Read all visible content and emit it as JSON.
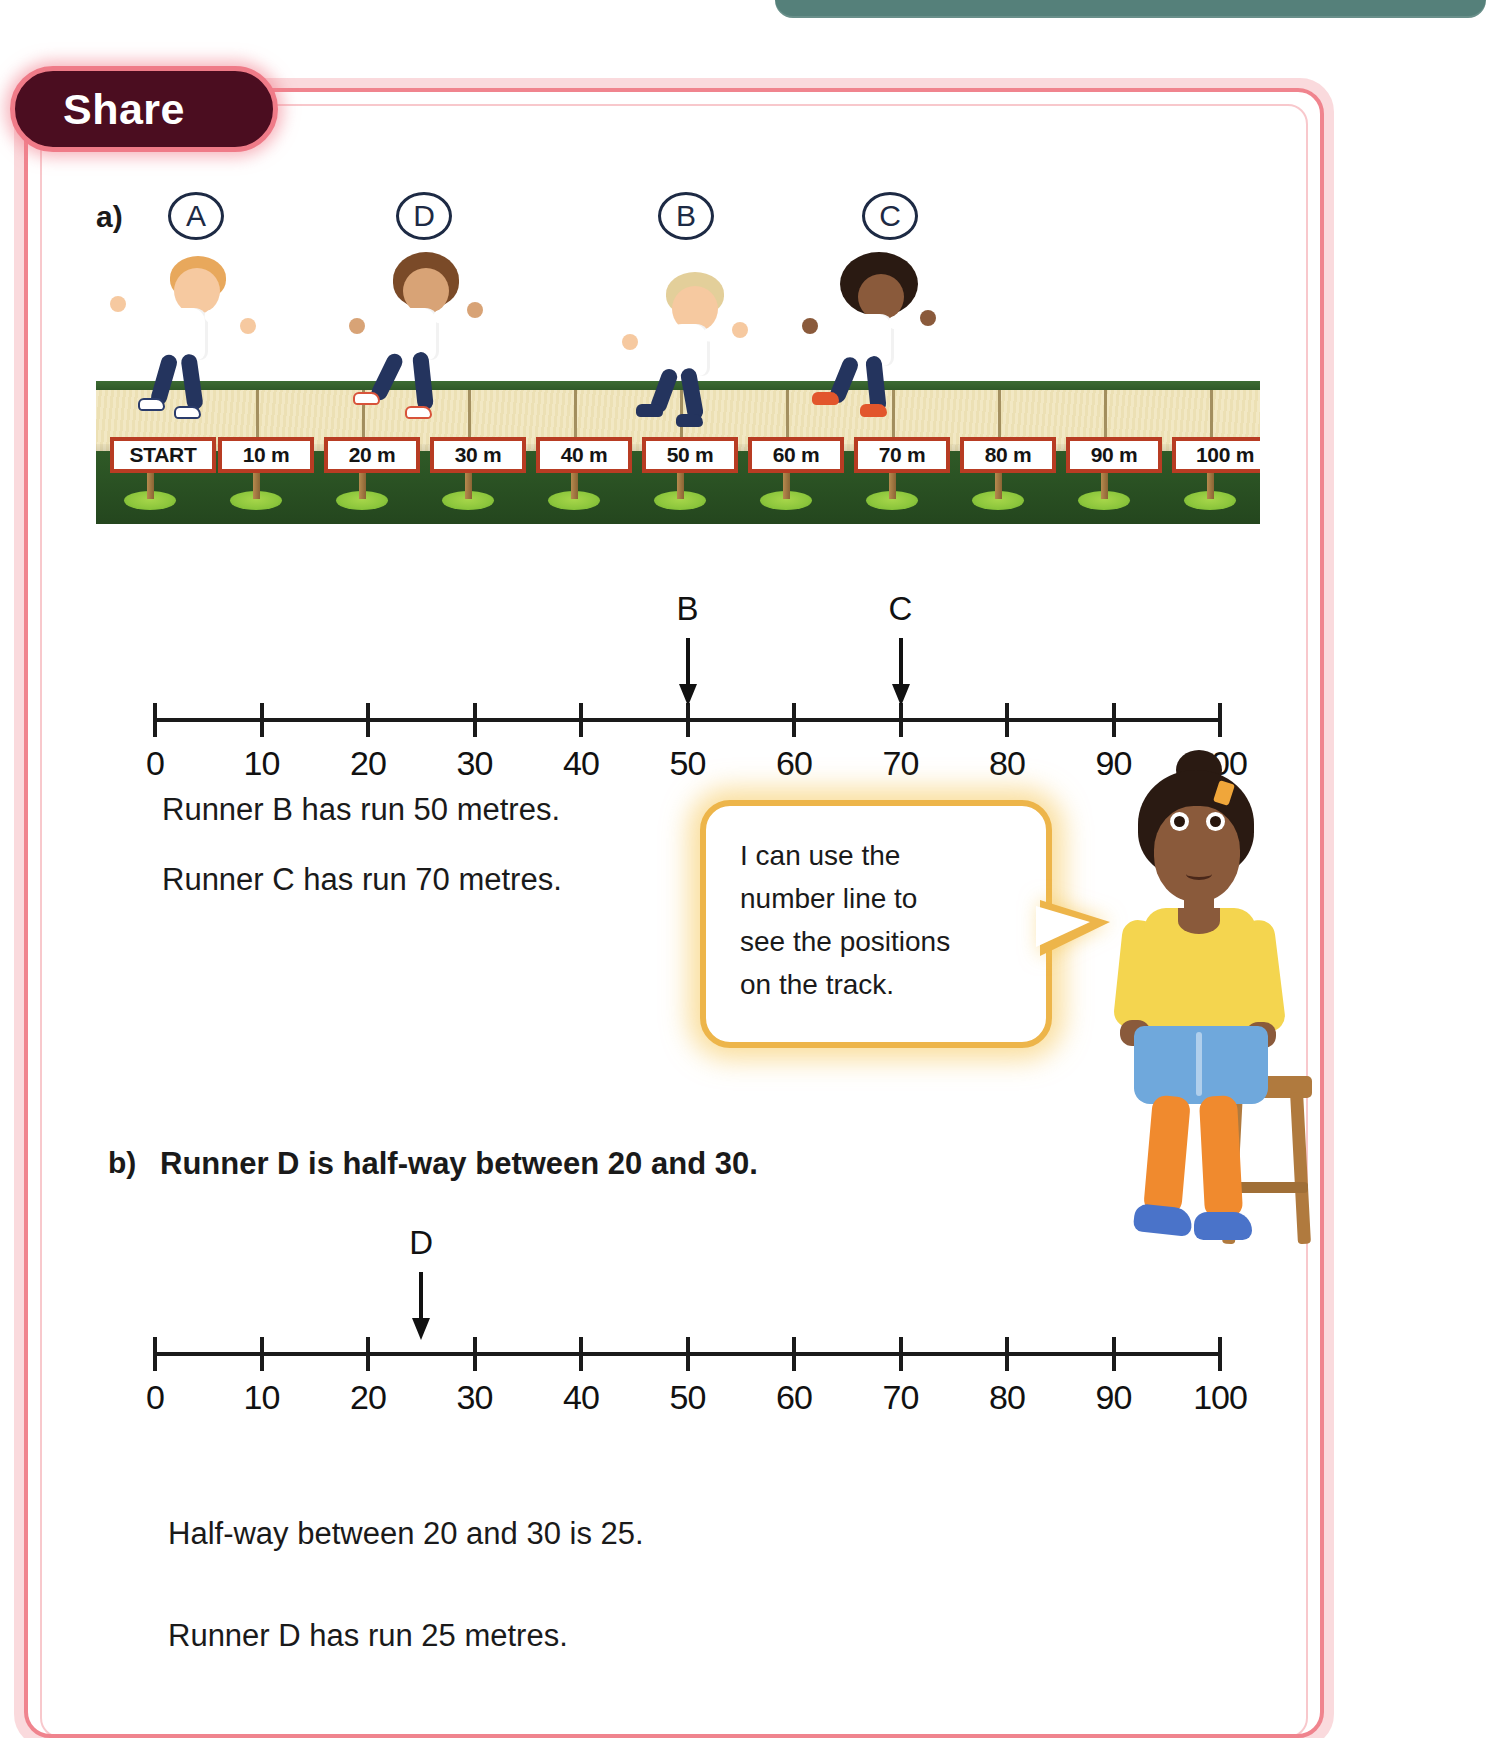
{
  "top_banner": {
    "text": "Unit 2 Place value          Lesson 5",
    "color": "#55807a"
  },
  "badge": {
    "label": "Share",
    "bg": "#4b0d20",
    "border": "#ef7b88"
  },
  "frame": {
    "border_color": "#f0848e"
  },
  "parts": {
    "a": {
      "marker": "a)"
    },
    "b": {
      "marker": "b)",
      "statement": "Runner D is half-way between 20 and 30."
    }
  },
  "track": {
    "runner_labels": [
      "A",
      "D",
      "B",
      "C"
    ],
    "signs": [
      "START",
      "10 m",
      "20 m",
      "30 m",
      "40 m",
      "50 m",
      "60 m",
      "70 m",
      "80 m",
      "90 m",
      "100 m"
    ],
    "sign_border_color": "#b83c23",
    "grass_color": "#2f5a27",
    "sand_color": "#f2e8c4"
  },
  "chart_data": [
    {
      "type": "line",
      "name": "number-line-a",
      "title": "",
      "xlabel": "",
      "ylabel": "",
      "x": [
        0,
        10,
        20,
        30,
        40,
        50,
        60,
        70,
        80,
        90,
        100
      ],
      "tick_labels": [
        "0",
        "10",
        "20",
        "30",
        "40",
        "50",
        "60",
        "70",
        "80",
        "90",
        "100"
      ],
      "xlim": [
        0,
        100
      ],
      "grid": false,
      "annotations": [
        {
          "label": "B",
          "value": 50
        },
        {
          "label": "C",
          "value": 70
        }
      ]
    },
    {
      "type": "line",
      "name": "number-line-b",
      "title": "",
      "xlabel": "",
      "ylabel": "",
      "x": [
        0,
        10,
        20,
        30,
        40,
        50,
        60,
        70,
        80,
        90,
        100
      ],
      "tick_labels": [
        "0",
        "10",
        "20",
        "30",
        "40",
        "50",
        "60",
        "70",
        "80",
        "90",
        "100"
      ],
      "xlim": [
        0,
        100
      ],
      "grid": false,
      "annotations": [
        {
          "label": "D",
          "value": 25
        }
      ]
    }
  ],
  "answers_a": [
    "Runner B has run 50 metres.",
    "Runner C has run 70 metres."
  ],
  "answers_b": [
    "Half-way between 20 and 30 is 25.",
    "Runner D has run 25 metres."
  ],
  "speech_bubble": {
    "lines": [
      "I can use the",
      "number line to",
      "see the positions",
      "on the track."
    ],
    "border_color": "#edb54a"
  }
}
